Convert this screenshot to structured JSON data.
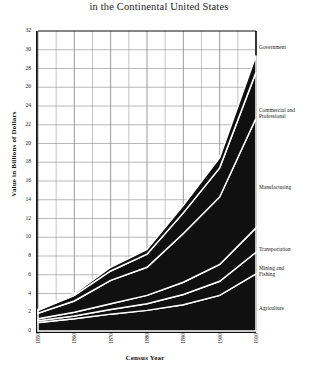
{
  "chart": {
    "title": "in the Continental United States",
    "xlabel": "Census Year",
    "ylabel": "Value in Billions of Dollars"
  },
  "chart_data": {
    "type": "area",
    "title": "in the Continental United States",
    "subtitle": "",
    "xlabel": "Census Year",
    "ylabel": "Value in Billions of Dollars",
    "stacked": true,
    "grid": true,
    "legend_position": "right-inline-labels",
    "x": [
      1850,
      1860,
      1870,
      1880,
      1890,
      1900,
      1910
    ],
    "xtick_labels": [
      "1850",
      "1860",
      "1870",
      "1880",
      "1890",
      "1900",
      "1910"
    ],
    "xlim": [
      1850,
      1910
    ],
    "ylim": [
      0,
      32
    ],
    "ytick_labels": [
      "0",
      "2",
      "4",
      "6",
      "8",
      "10",
      "12",
      "14",
      "16",
      "18",
      "20",
      "22",
      "24",
      "26",
      "28",
      "30",
      "32"
    ],
    "ytick_values": [
      0,
      2,
      4,
      6,
      8,
      10,
      12,
      14,
      16,
      18,
      20,
      22,
      24,
      26,
      28,
      30,
      32
    ],
    "ytick_interval": 2,
    "series": [
      {
        "name": "Agriculture",
        "values": [
          0.9,
          1.3,
          1.8,
          2.2,
          2.8,
          3.8,
          6.1
        ]
      },
      {
        "name": "Mining and Fishing",
        "values": [
          0.2,
          0.3,
          0.5,
          0.7,
          1.1,
          1.5,
          2.3
        ]
      },
      {
        "name": "Transportation",
        "values": [
          0.2,
          0.4,
          0.6,
          0.9,
          1.3,
          1.8,
          2.6
        ]
      },
      {
        "name": "Manufacturing",
        "values": [
          0.6,
          1.2,
          2.5,
          3.0,
          5.2,
          7.2,
          11.7
        ]
      },
      {
        "name": "Commercial and Professional",
        "values": [
          0.3,
          0.6,
          1.0,
          1.4,
          2.2,
          3.1,
          4.9
        ]
      },
      {
        "name": "Government",
        "values": [
          0.1,
          0.2,
          0.4,
          0.5,
          0.8,
          1.1,
          1.8
        ]
      }
    ],
    "series_order_bottom_to_top": [
      "Agriculture",
      "Mining and Fishing",
      "Transportation",
      "Manufacturing",
      "Commercial and Professional",
      "Government"
    ],
    "stack_totals": [
      2.3,
      4.0,
      6.8,
      8.7,
      13.4,
      18.5,
      29.4
    ],
    "fill_color": "#101010",
    "background_color": "#ffffff",
    "grid_color": "#8a8a8a",
    "axis_color": "#111111"
  },
  "annotations": [
    {
      "label": "Government",
      "top": 44,
      "left": 259
    },
    {
      "label": "Commercial and\nProfessional",
      "top": 107,
      "left": 259
    },
    {
      "label": "Manufacturing",
      "top": 184,
      "left": 259
    },
    {
      "label": "Transportation",
      "top": 246,
      "left": 259
    },
    {
      "label": "Mining and\n    Fishing",
      "top": 265,
      "left": 259
    },
    {
      "label": "Agriculture",
      "top": 305,
      "left": 259
    }
  ]
}
